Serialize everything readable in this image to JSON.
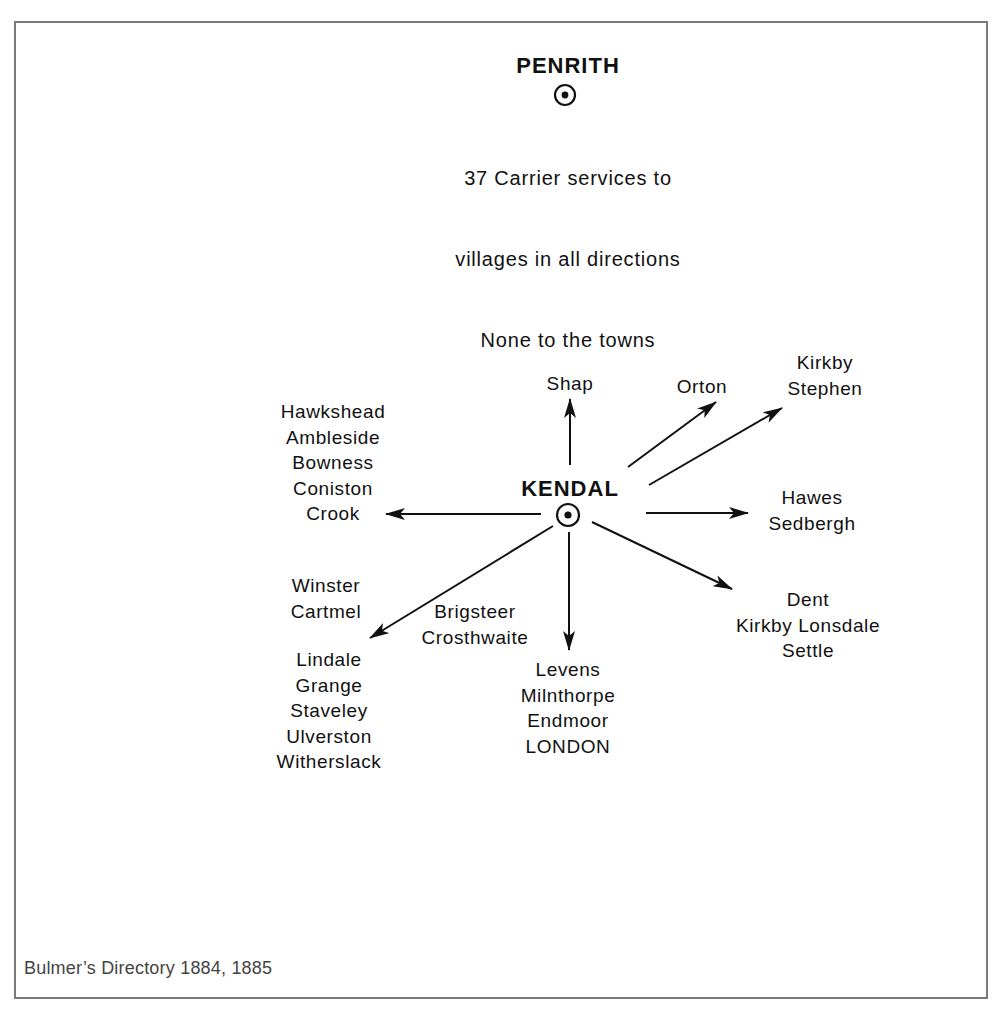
{
  "diagram": {
    "type": "carrier-services-radial",
    "penrith": {
      "name": "PENRITH",
      "note_lines": [
        "37 Carrier services to",
        "villages in all directions",
        "None to the towns"
      ]
    },
    "kendal": {
      "name": "KENDAL",
      "destinations": [
        {
          "direction": "north",
          "places": "Shap"
        },
        {
          "direction": "north-east",
          "places": "Orton"
        },
        {
          "direction": "north-east-far",
          "places": "Kirkby\nStephen"
        },
        {
          "direction": "east",
          "places": "Hawes\nSedbergh"
        },
        {
          "direction": "south-east",
          "places": "Dent\nKirkby Lonsdale\nSettle"
        },
        {
          "direction": "south",
          "places": "Levens\nMilnthorpe\nEndmoor\nLONDON"
        },
        {
          "direction": "south-west-mid",
          "places": "Brigsteer\nCrosthwaite"
        },
        {
          "direction": "south-west-upper",
          "places": "Winster\nCartmel"
        },
        {
          "direction": "south-west",
          "places": "Lindale\nGrange\nStaveley\nUlverston\nWitherslack"
        },
        {
          "direction": "west",
          "places": "Hawkshead\nAmbleside\nBowness\nConiston\nCrook"
        }
      ]
    },
    "caption": "Bulmer’s Directory 1884, 1885",
    "colors": {
      "ink": "#111111",
      "frame": "#7a7a7a",
      "caption": "#444444"
    }
  }
}
